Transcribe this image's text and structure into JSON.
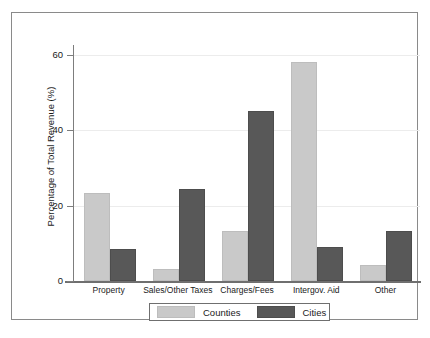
{
  "chart_data": {
    "type": "bar",
    "title": "",
    "xlabel": "",
    "ylabel": "Percentage of Total Revenue (%)",
    "categories": [
      "Property",
      "Sales/Other Taxes",
      "Charges/Fees",
      "Intergov. Aid",
      "Other"
    ],
    "series": [
      {
        "name": "Counties",
        "color": "#c9c9c9",
        "values": [
          22.7,
          2.6,
          12.6,
          57.4,
          3.8
        ]
      },
      {
        "name": "Cities",
        "color": "#585858",
        "values": [
          8.0,
          23.8,
          44.4,
          8.6,
          12.6
        ]
      }
    ],
    "ylim": [
      0,
      62
    ],
    "yticks": [
      0,
      20,
      40,
      60
    ],
    "ytick_labels": [
      "0",
      "20",
      "40",
      "60"
    ],
    "grid": true,
    "grid_axis": "y",
    "legend_position": "below-axis-center",
    "legend_entries": [
      "Counties",
      "Cities"
    ]
  },
  "figure": {
    "frame_color": "#8a8a8a",
    "background": "#ffffff",
    "axis_color": "#7d7d7d",
    "gridline_color": "#ececec"
  }
}
